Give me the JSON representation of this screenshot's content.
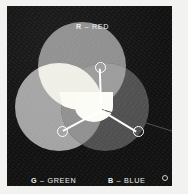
{
  "figure": {
    "background_color": "#121111",
    "marker_color": "#ffffff",
    "callout_color": "#4d4d4d"
  },
  "labels": {
    "red": {
      "key": "R",
      "sep": " – ",
      "name": "RED"
    },
    "green": {
      "key": "G",
      "sep": " – ",
      "name": "GREEN"
    },
    "blue": {
      "key": "B",
      "sep": " – ",
      "name": "BLUE"
    }
  },
  "chart_data": {
    "type": "diagram",
    "subtype": "venn-three-circle",
    "sets": [
      {
        "name": "RED",
        "key": "R",
        "cx": 75,
        "cy": 60,
        "r": 44,
        "fill": "#8d8d8d"
      },
      {
        "name": "GREEN",
        "key": "G",
        "cx": 52,
        "cy": 101,
        "r": 44,
        "fill": "#a3a3a3"
      },
      {
        "name": "BLUE",
        "key": "B",
        "cx": 98,
        "cy": 101,
        "r": 44,
        "fill": "#4f4f4f"
      }
    ],
    "intersections": [
      {
        "sets": [
          "RED",
          "GREEN"
        ],
        "result": "YELLOW",
        "fill": "#f0efe6"
      },
      {
        "sets": [
          "RED",
          "BLUE"
        ],
        "result": "MAGENTA",
        "fill": "#9a9a9a"
      },
      {
        "sets": [
          "GREEN",
          "BLUE"
        ],
        "result": "CYAN",
        "fill": "#8f8f8f"
      },
      {
        "sets": [
          "RED",
          "GREEN",
          "BLUE"
        ],
        "result": "WHITE",
        "fill": "#fbfbf4"
      }
    ],
    "markers": [
      {
        "name": "red-node",
        "x": 93,
        "y": 61
      },
      {
        "name": "green-node",
        "x": 55,
        "y": 125
      },
      {
        "name": "blue-node",
        "x": 131,
        "y": 125
      },
      {
        "name": "center-node",
        "x": 94,
        "y": 103
      },
      {
        "name": "legend-node",
        "x": 158,
        "y": 172
      }
    ]
  }
}
